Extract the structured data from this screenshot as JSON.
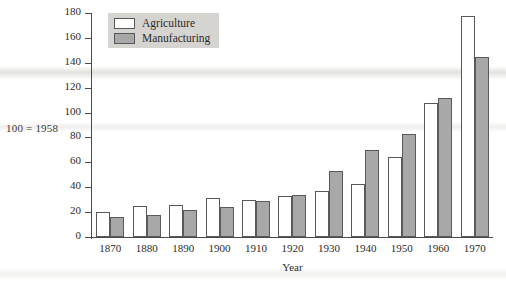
{
  "note": "100 = 1958",
  "legend": {
    "entries": [
      {
        "label": "Agriculture",
        "swatch": "white-square-icon",
        "color": "#ffffff"
      },
      {
        "label": "Manufacturing",
        "swatch": "gray-square-icon",
        "color": "#a8a8a8"
      }
    ]
  },
  "axis": {
    "x_title": "Year",
    "y_ticks": [
      "0",
      "20",
      "40",
      "60",
      "80",
      "100",
      "120",
      "140",
      "160",
      "180"
    ]
  },
  "chart_data": {
    "type": "bar",
    "title": "",
    "subtitle": "100 = 1958",
    "xlabel": "Year",
    "ylabel": "",
    "categories": [
      "1870",
      "1880",
      "1890",
      "1900",
      "1910",
      "1920",
      "1930",
      "1940",
      "1950",
      "1960",
      "1970"
    ],
    "series": [
      {
        "name": "Agriculture",
        "color": "#ffffff",
        "values": [
          20,
          25,
          26,
          31,
          30,
          33,
          37,
          43,
          64,
          108,
          178
        ]
      },
      {
        "name": "Manufacturing",
        "color": "#a8a8a8",
        "values": [
          16,
          18,
          22,
          24,
          29,
          34,
          53,
          70,
          83,
          112,
          145
        ]
      }
    ],
    "ylim": [
      0,
      180
    ],
    "ytick_step": 20,
    "grid": false,
    "legend_position": "top-left"
  }
}
